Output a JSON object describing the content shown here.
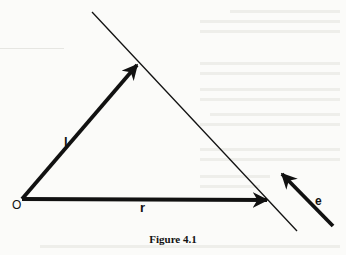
{
  "figure": {
    "caption": "Figure 4.1",
    "labels": {
      "origin": "O",
      "vector_l": "l",
      "vector_r": "r",
      "vector_e": "e"
    },
    "colors": {
      "ink": "#111111",
      "paper": "#fbfbf9"
    },
    "elements": {
      "line": {
        "x1": 92,
        "y1": 12,
        "x2": 297,
        "y2": 231
      },
      "vector_l": {
        "x1": 22,
        "y1": 199,
        "x2": 138,
        "y2": 64
      },
      "vector_r": {
        "x1": 22,
        "y1": 199,
        "x2": 268,
        "y2": 200
      },
      "vector_e": {
        "x1": 333,
        "y1": 226,
        "x2": 281,
        "y2": 173
      }
    }
  }
}
